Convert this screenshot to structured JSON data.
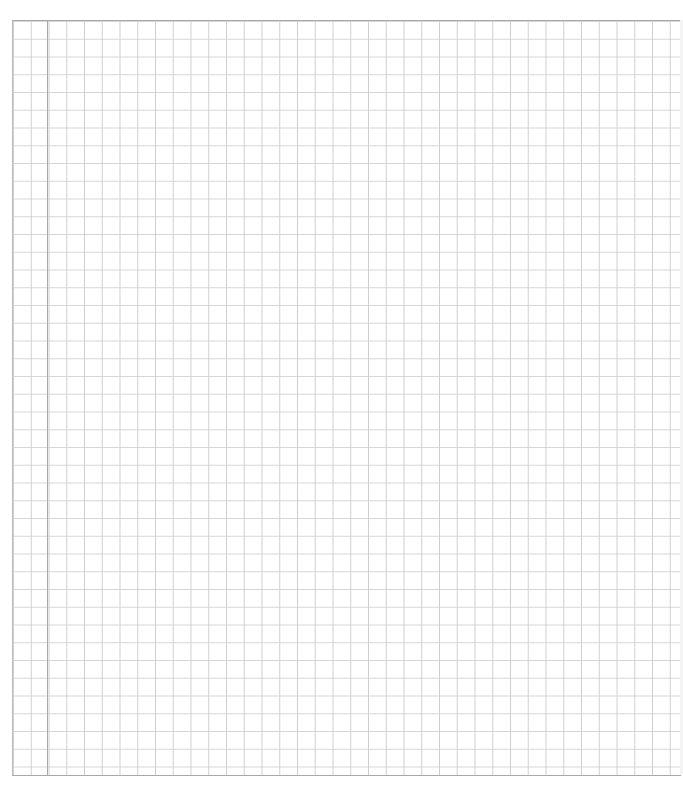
{
  "page": {
    "type": "graph-paper-sheet",
    "grid": {
      "cell_size_px": 17.75,
      "line_color": "#d6d6d6",
      "margin_line_color": "#a9a9a9",
      "border_color": "#a8a8a8"
    },
    "content_text": ""
  }
}
